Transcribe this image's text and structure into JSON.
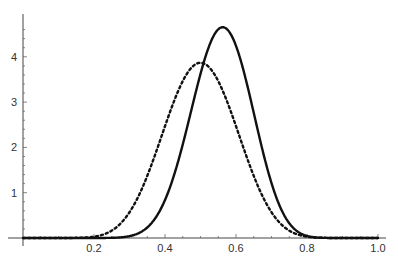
{
  "chart_data": {
    "type": "line",
    "title": "",
    "xlabel": "",
    "ylabel": "",
    "xlim": [
      0,
      1.0
    ],
    "ylim": [
      0,
      4.75
    ],
    "grid": false,
    "legend": null,
    "x_ticks": [
      "0.2",
      "0.4",
      "0.6",
      "0.8",
      "1.0"
    ],
    "x_tick_values": [
      0.2,
      0.4,
      0.6,
      0.8,
      1.0
    ],
    "y_ticks": [
      "1",
      "2",
      "3",
      "4"
    ],
    "y_tick_values": [
      1,
      2,
      3,
      4
    ],
    "x": [
      0.0,
      0.05,
      0.1,
      0.15,
      0.2,
      0.25,
      0.3,
      0.35,
      0.4,
      0.45,
      0.5,
      0.55,
      0.6,
      0.65,
      0.7,
      0.75,
      0.8,
      0.85,
      0.9,
      0.95,
      1.0
    ],
    "series": [
      {
        "name": "solid curve",
        "style": "solid",
        "color": "#111111",
        "model": {
          "dist": "beta",
          "a": 19,
          "b": 15
        },
        "peak": {
          "x": 0.56,
          "y": 4.68
        },
        "values": [
          0,
          0,
          0,
          0,
          0.001,
          0.012,
          0.08,
          0.35,
          1.05,
          2.3,
          3.7,
          4.65,
          4.55,
          3.4,
          1.9,
          0.75,
          0.2,
          0.03,
          0,
          0,
          0
        ]
      },
      {
        "name": "dotted curve",
        "style": "dotted",
        "color": "#111111",
        "model": {
          "dist": "beta",
          "a": 12,
          "b": 12
        },
        "peak": {
          "x": 0.5,
          "y": 3.87
        },
        "values": [
          0,
          0,
          0.001,
          0.015,
          0.09,
          0.35,
          0.95,
          1.95,
          3.0,
          3.7,
          3.87,
          3.7,
          3.0,
          1.95,
          0.95,
          0.35,
          0.09,
          0.015,
          0.001,
          0,
          0
        ]
      }
    ]
  }
}
